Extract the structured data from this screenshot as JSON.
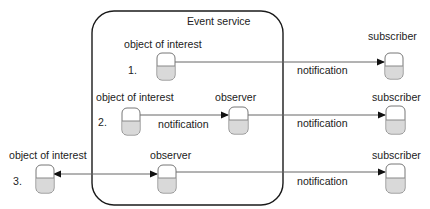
{
  "diagram": {
    "title": "Event service",
    "colors": {
      "stroke": "#1a1a1a",
      "line": "#555555",
      "node_fill_bottom": "#d9d9d9",
      "node_border": "#777777"
    },
    "rows": [
      {
        "number": "1.",
        "source": {
          "label": "object of interest"
        },
        "observer": null,
        "subscriber": {
          "label": "subscriber"
        },
        "edges": [
          {
            "from": "object of interest",
            "to": "subscriber",
            "label": "notification",
            "direction": "forward"
          }
        ]
      },
      {
        "number": "2.",
        "source": {
          "label": "object of interest"
        },
        "observer": {
          "label": "observer"
        },
        "subscriber": {
          "label": "subscriber"
        },
        "edges": [
          {
            "from": "object of interest",
            "to": "observer",
            "label": "notification",
            "direction": "forward"
          },
          {
            "from": "observer",
            "to": "subscriber",
            "label": "notification",
            "direction": "forward"
          }
        ]
      },
      {
        "number": "3.",
        "source": {
          "label": "object of interest"
        },
        "observer": {
          "label": "observer"
        },
        "subscriber": {
          "label": "subscriber"
        },
        "edges": [
          {
            "from": "observer",
            "to": "object of interest",
            "label": "",
            "direction": "bidirectional"
          },
          {
            "from": "observer",
            "to": "subscriber",
            "label": "notification",
            "direction": "forward"
          }
        ]
      }
    ]
  }
}
